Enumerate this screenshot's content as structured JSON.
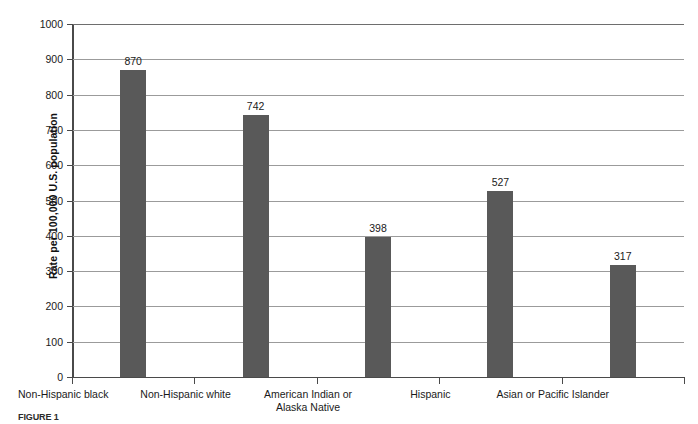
{
  "chart_data": {
    "type": "bar",
    "title": "",
    "xlabel": "",
    "ylabel": "Rate per 100,000 U.S. population",
    "ylim": [
      0,
      1000
    ],
    "ytick_step": 100,
    "grid": true,
    "legend": "none",
    "bar_color": "#595959",
    "categories": [
      "Non-Hispanic black",
      "Non-Hispanic white",
      "American Indian or\nAlaska Native",
      "Hispanic",
      "Asian or Pacific Islander"
    ],
    "values": [
      870,
      742,
      398,
      527,
      317
    ],
    "yticks": [
      0,
      100,
      200,
      300,
      400,
      500,
      600,
      700,
      800,
      900,
      1000
    ]
  },
  "axis": {
    "y_title": "Rate per 100,000 U.S. population",
    "tick_labels": [
      "1000",
      "900",
      "800",
      "700",
      "600",
      "500",
      "400",
      "300",
      "200",
      "100",
      "0"
    ]
  },
  "categories": [
    {
      "label_line1": "Non-Hispanic black",
      "label_line2": "",
      "value_label": "870"
    },
    {
      "label_line1": "Non-Hispanic white",
      "label_line2": "",
      "value_label": "742"
    },
    {
      "label_line1": "American Indian or",
      "label_line2": "Alaska Native",
      "value_label": "398"
    },
    {
      "label_line1": "Hispanic",
      "label_line2": "",
      "value_label": "527"
    },
    {
      "label_line1": "Asian or Pacific Islander",
      "label_line2": "",
      "value_label": "317"
    }
  ],
  "caption": {
    "figure_label": "FIGURE 1",
    "text": ""
  }
}
